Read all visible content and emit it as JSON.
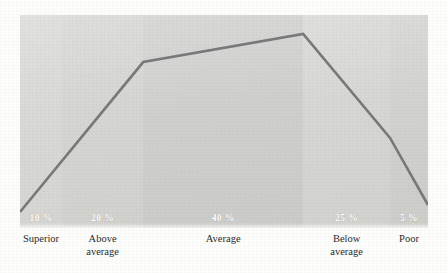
{
  "chart_data": {
    "type": "line",
    "title": "",
    "subtitle": "",
    "xlabel": "",
    "ylabel": "",
    "grid": false,
    "legend": "none",
    "categories": [
      "Superior",
      "Above average",
      "Average",
      "Below average",
      "Poor"
    ],
    "band_percent_labels": [
      "10 %",
      "20 %",
      "40 %",
      "25 %",
      "5 %"
    ],
    "values": [
      10,
      20,
      40,
      25,
      5
    ],
    "ylim": [
      0,
      45
    ],
    "annotation": "Normal distribution curve across five performance rating bands",
    "points": [
      {
        "category": "Superior",
        "label": "10 %",
        "value": 10,
        "x_frac": 0.0,
        "y_frac": 0.925
      },
      {
        "category": "Above average",
        "label": "20 %",
        "value": 20,
        "x_frac": 0.302,
        "y_frac": 0.221
      },
      {
        "category": "Average",
        "label": "40 %",
        "value": 40,
        "x_frac": 0.694,
        "y_frac": 0.089
      },
      {
        "category": "Below average",
        "label": "25 %",
        "value": 25,
        "x_frac": 0.907,
        "y_frac": 0.577
      },
      {
        "category": "Poor",
        "label": "5 %",
        "value": 5,
        "x_frac": 1.0,
        "y_frac": 0.892
      }
    ],
    "bands": [
      {
        "name": "Superior",
        "label": "Superior",
        "percent_label": "10 %",
        "value": 10,
        "color": "#d9d9d6",
        "start_frac": 0.0,
        "end_frac": 0.103
      },
      {
        "name": "Above average",
        "label": "Above\naverage",
        "percent_label": "20 %",
        "value": 20,
        "color": "#d5d5d2",
        "start_frac": 0.103,
        "end_frac": 0.302
      },
      {
        "name": "Average",
        "label": "Average",
        "percent_label": "40 %",
        "value": 40,
        "color": "#cfcfcd",
        "start_frac": 0.302,
        "end_frac": 0.694
      },
      {
        "name": "Below average",
        "label": "Below\naverage",
        "percent_label": "25 %",
        "value": 25,
        "color": "#d6d6d3",
        "start_frac": 0.694,
        "end_frac": 0.907
      },
      {
        "name": "Poor",
        "label": "Poor",
        "percent_label": "5 %",
        "value": 5,
        "color": "#d1d1ce",
        "start_frac": 0.907,
        "end_frac": 1.0
      }
    ],
    "colors": {
      "line": "#79797a",
      "percent_text": "#ffffff",
      "category_text": "#2b2b2b",
      "background": "#fdfdfc"
    }
  }
}
